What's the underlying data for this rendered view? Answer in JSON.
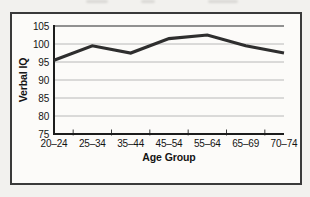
{
  "chart_data": {
    "type": "line",
    "categories": [
      "20–24",
      "25–34",
      "35–44",
      "45–54",
      "55–64",
      "65–69",
      "70–74"
    ],
    "values": [
      95.5,
      99.5,
      97.5,
      101.5,
      102.5,
      99.5,
      97.5
    ],
    "title": "",
    "xlabel": "Age Group",
    "ylabel": "Verbal IQ",
    "ylim": [
      75,
      105
    ],
    "yticks": [
      75,
      80,
      85,
      90,
      95,
      100,
      105
    ],
    "grid": true,
    "legend": "none",
    "line_color": "#2e2e2e",
    "grid_color": "#b8b8b8",
    "top_border_color": "#6e6e6e",
    "axis_color": "#1c1c1c"
  }
}
